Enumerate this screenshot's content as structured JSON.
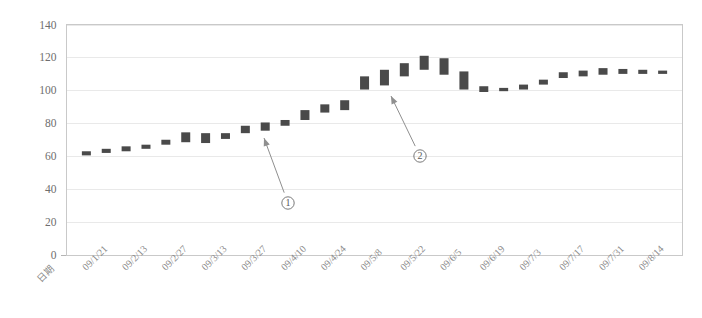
{
  "chart_data": {
    "type": "bar",
    "title": "",
    "subtitle": "",
    "xlabel": "日期",
    "ylabel": "",
    "ylim": [
      0,
      140
    ],
    "ytick_step": 20,
    "yticks": [
      0,
      20,
      40,
      60,
      80,
      100,
      120,
      140
    ],
    "grid": true,
    "legend": "none",
    "bar_color": "#4a4a4a",
    "grid_color": "#e9e9e9",
    "axis_color": "#b4b4b4",
    "categories": [
      "09/1/21",
      "09/2/13",
      "09/2/27",
      "09/3/13",
      "09/3/27",
      "09/4/10",
      "09/4/24",
      "09/5/8",
      "09/5/22",
      "09/6/5",
      "09/6/19",
      "09/7/3",
      "09/7/17",
      "09/7/31",
      "09/8/14"
    ],
    "tick_every": 2,
    "series": [
      {
        "name": "range",
        "bars": [
          {
            "index": 0,
            "low": 60.5,
            "high": 63.0
          },
          {
            "index": 1,
            "low": 62.0,
            "high": 64.5
          },
          {
            "index": 2,
            "low": 63.0,
            "high": 66.0
          },
          {
            "index": 3,
            "low": 64.5,
            "high": 67.0
          },
          {
            "index": 4,
            "low": 67.0,
            "high": 70.0
          },
          {
            "index": 5,
            "low": 68.5,
            "high": 74.5
          },
          {
            "index": 6,
            "low": 68.0,
            "high": 74.0
          },
          {
            "index": 7,
            "low": 70.5,
            "high": 74.0
          },
          {
            "index": 8,
            "low": 74.0,
            "high": 78.5
          },
          {
            "index": 9,
            "low": 75.5,
            "high": 80.5
          },
          {
            "index": 10,
            "low": 78.5,
            "high": 82.0
          },
          {
            "index": 11,
            "low": 82.0,
            "high": 88.0
          },
          {
            "index": 12,
            "low": 86.5,
            "high": 91.5
          },
          {
            "index": 13,
            "low": 88.0,
            "high": 94.0
          },
          {
            "index": 14,
            "low": 100.5,
            "high": 108.5
          },
          {
            "index": 15,
            "low": 103.0,
            "high": 112.5
          },
          {
            "index": 16,
            "low": 108.5,
            "high": 116.5
          },
          {
            "index": 17,
            "low": 112.5,
            "high": 121.0
          },
          {
            "index": 18,
            "low": 109.5,
            "high": 119.5
          },
          {
            "index": 19,
            "low": 100.5,
            "high": 111.5
          },
          {
            "index": 20,
            "low": 99.0,
            "high": 102.5
          },
          {
            "index": 21,
            "low": 99.5,
            "high": 101.5
          },
          {
            "index": 22,
            "low": 100.5,
            "high": 103.5
          },
          {
            "index": 23,
            "low": 103.5,
            "high": 106.5
          },
          {
            "index": 24,
            "low": 107.5,
            "high": 111.0
          },
          {
            "index": 25,
            "low": 108.5,
            "high": 112.0
          },
          {
            "index": 26,
            "low": 109.5,
            "high": 113.5
          },
          {
            "index": 27,
            "low": 110.0,
            "high": 113.0
          },
          {
            "index": 28,
            "low": 110.0,
            "high": 112.5
          },
          {
            "index": 29,
            "low": 110.0,
            "high": 112.0
          }
        ]
      }
    ],
    "annotations": [
      {
        "id": "annotation-1",
        "label": "①",
        "label_x": 288,
        "label_y": 203,
        "target_x": 264,
        "target_y": 138,
        "points_to_bar": 13
      },
      {
        "id": "annotation-2",
        "label": "②",
        "label_x": 420,
        "label_y": 156,
        "target_x": 391,
        "target_y": 96,
        "points_to_bar": 14
      }
    ]
  }
}
